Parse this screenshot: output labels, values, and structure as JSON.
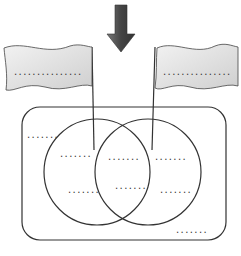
{
  "diagram": {
    "type": "venn-with-flags",
    "colors": {
      "line": "#333333",
      "arrow_fill": "#555555",
      "flag_fill": "#e4e4e4",
      "dots": "#333333"
    },
    "arrow": {
      "direction": "down"
    },
    "flags": [
      {
        "id": "left",
        "label": "..............."
      },
      {
        "id": "right",
        "label": "..............."
      }
    ],
    "outer_region": {
      "label_top_left": ".......",
      "label_bottom_right": "......."
    },
    "circles": {
      "left_only": [
        ".......",
        "......."
      ],
      "intersection": [
        ".......",
        "......."
      ],
      "right_only": [
        ".......",
        "......."
      ]
    }
  }
}
